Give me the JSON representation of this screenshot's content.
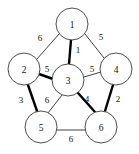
{
  "figure": {
    "kind": "weighted-undirected-graph",
    "width": 139,
    "height": 154,
    "background_color": "#ffffff",
    "node_fill_color": "#ffffff",
    "node_stroke_color": "#3a3a3a",
    "edge_color": "#2b2b2b",
    "highlight_edge_color": "#000000"
  },
  "nodes": [
    {
      "id": "1",
      "label": "1",
      "cx": 72,
      "cy": 24,
      "r": 16
    },
    {
      "id": "2",
      "label": "2",
      "cx": 24,
      "cy": 69,
      "r": 16
    },
    {
      "id": "3",
      "label": "3",
      "cx": 68,
      "cy": 80,
      "r": 16
    },
    {
      "id": "4",
      "label": "4",
      "cx": 116,
      "cy": 69,
      "r": 16
    },
    {
      "id": "5",
      "label": "5",
      "cx": 41,
      "cy": 127,
      "r": 16
    },
    {
      "id": "6",
      "label": "6",
      "cx": 101,
      "cy": 127,
      "r": 16
    }
  ],
  "edges": [
    {
      "id": "e-1-2",
      "from": "1",
      "to": "2",
      "weight": "6",
      "highlighted": false,
      "x1": 59,
      "y1": 34,
      "x2": 37,
      "y2": 59,
      "lx": 40,
      "ly": 38
    },
    {
      "id": "e-1-4",
      "from": "1",
      "to": "4",
      "weight": "5",
      "highlighted": false,
      "x1": 85,
      "y1": 34,
      "x2": 104,
      "y2": 58,
      "lx": 101,
      "ly": 37
    },
    {
      "id": "e-1-3",
      "from": "1",
      "to": "3",
      "weight": "1",
      "highlighted": true,
      "x1": 71,
      "y1": 40,
      "x2": 69,
      "y2": 64,
      "lx": 78,
      "ly": 50
    },
    {
      "id": "e-2-3",
      "from": "2",
      "to": "3",
      "weight": "5",
      "highlighted": true,
      "x1": 39,
      "y1": 74,
      "x2": 53,
      "y2": 79,
      "lx": 47,
      "ly": 69
    },
    {
      "id": "e-3-4",
      "from": "3",
      "to": "4",
      "weight": "5",
      "highlighted": false,
      "x1": 84,
      "y1": 77,
      "x2": 101,
      "y2": 72,
      "lx": 92,
      "ly": 69
    },
    {
      "id": "e-2-5",
      "from": "2",
      "to": "5",
      "weight": "3",
      "highlighted": true,
      "x1": 28,
      "y1": 85,
      "x2": 37,
      "y2": 111,
      "lx": 21,
      "ly": 100
    },
    {
      "id": "e-3-5",
      "from": "3",
      "to": "5",
      "weight": "6",
      "highlighted": false,
      "x1": 62,
      "y1": 95,
      "x2": 48,
      "y2": 113,
      "lx": 47,
      "ly": 100
    },
    {
      "id": "e-3-6",
      "from": "3",
      "to": "6",
      "weight": "4",
      "highlighted": true,
      "x1": 78,
      "y1": 93,
      "x2": 95,
      "y2": 112,
      "lx": 87,
      "ly": 99
    },
    {
      "id": "e-4-6",
      "from": "4",
      "to": "6",
      "weight": "2",
      "highlighted": true,
      "x1": 113,
      "y1": 85,
      "x2": 105,
      "y2": 111,
      "lx": 118,
      "ly": 99
    },
    {
      "id": "e-5-6",
      "from": "5",
      "to": "6",
      "weight": "6",
      "highlighted": false,
      "x1": 57,
      "y1": 130,
      "x2": 85,
      "y2": 130,
      "lx": 71,
      "ly": 139
    }
  ]
}
